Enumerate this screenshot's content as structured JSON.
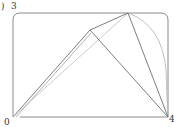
{
  "figure": {
    "panel_mark": ")",
    "labels": {
      "top_left": "3",
      "bottom_left": "0",
      "bottom_right": "4"
    },
    "colors": {
      "frame": "#8a8a8a",
      "edge": "#6e6e6e",
      "arc": "#b8b8b8",
      "text": "#333333"
    },
    "vertices": {
      "v0": [
        13,
        117
      ],
      "vA": [
        90,
        30
      ],
      "vB": [
        128,
        13
      ],
      "v4": [
        168,
        117
      ]
    }
  }
}
